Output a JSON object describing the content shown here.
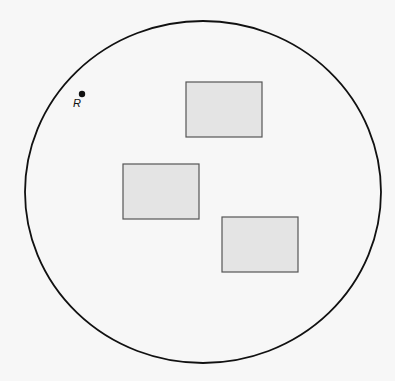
{
  "diagram": {
    "background": "#f7f7f7",
    "boundary": {
      "shape": "ellipse",
      "cx": 203,
      "cy": 192,
      "rx": 178,
      "ry": 171,
      "stroke": "#111111"
    },
    "point": {
      "label": "R",
      "cx": 82,
      "cy": 94,
      "r": 3.2
    },
    "rectangles": [
      {
        "name": "rectangle-top-right",
        "x": 186,
        "y": 82,
        "w": 76,
        "h": 55
      },
      {
        "name": "rectangle-middle-left",
        "x": 123,
        "y": 164,
        "w": 76,
        "h": 55
      },
      {
        "name": "rectangle-bottom-right",
        "x": 222,
        "y": 217,
        "w": 76,
        "h": 55
      }
    ],
    "rect_fill": "#e4e4e4",
    "rect_stroke": "#555555"
  }
}
